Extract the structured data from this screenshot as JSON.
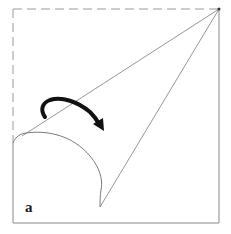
{
  "figure": {
    "panel_label": "a",
    "colors": {
      "background": "#ffffff",
      "line": "#8a8a8a",
      "dashed": "#9a9a9a",
      "arrow": "#111111"
    },
    "elements": [
      "square-outline",
      "dashed-top-edge",
      "dashed-left-edge-upper",
      "cone-lines-from-top-right-corner",
      "curved-bottom-arc",
      "rotation-arrow"
    ]
  }
}
